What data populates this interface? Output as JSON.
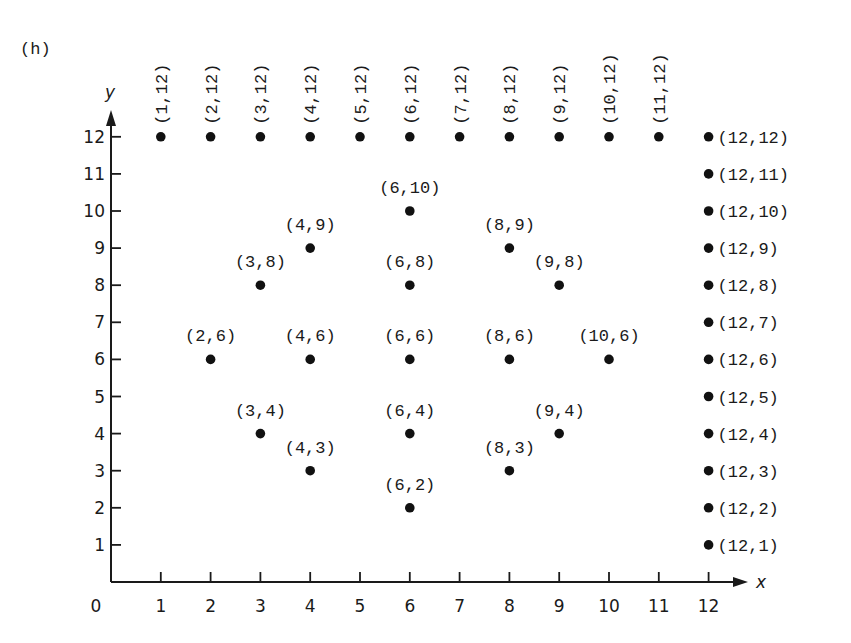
{
  "panel_label": "(h)",
  "chart_data": {
    "type": "scatter",
    "title": "",
    "panel_label": "(h)",
    "xlabel": "x",
    "ylabel": "y",
    "origin_label": "0",
    "xlim": [
      0,
      12
    ],
    "ylim": [
      0,
      12
    ],
    "grid": false,
    "legend": null,
    "x_ticks": [
      1,
      2,
      3,
      4,
      5,
      6,
      7,
      8,
      9,
      10,
      11,
      12
    ],
    "y_ticks": [
      1,
      2,
      3,
      4,
      5,
      6,
      7,
      8,
      9,
      10,
      11,
      12
    ],
    "points": [
      {
        "x": 1,
        "y": 12,
        "label": "(1,12)",
        "label_pos": "vertical"
      },
      {
        "x": 2,
        "y": 12,
        "label": "(2,12)",
        "label_pos": "vertical"
      },
      {
        "x": 3,
        "y": 12,
        "label": "(3,12)",
        "label_pos": "vertical"
      },
      {
        "x": 4,
        "y": 12,
        "label": "(4,12)",
        "label_pos": "vertical"
      },
      {
        "x": 5,
        "y": 12,
        "label": "(5,12)",
        "label_pos": "vertical"
      },
      {
        "x": 6,
        "y": 12,
        "label": "(6,12)",
        "label_pos": "vertical"
      },
      {
        "x": 7,
        "y": 12,
        "label": "(7,12)",
        "label_pos": "vertical"
      },
      {
        "x": 8,
        "y": 12,
        "label": "(8,12)",
        "label_pos": "vertical"
      },
      {
        "x": 9,
        "y": 12,
        "label": "(9,12)",
        "label_pos": "vertical"
      },
      {
        "x": 10,
        "y": 12,
        "label": "(10,12)",
        "label_pos": "vertical"
      },
      {
        "x": 11,
        "y": 12,
        "label": "(11,12)",
        "label_pos": "vertical"
      },
      {
        "x": 12,
        "y": 12,
        "label": "(12,12)",
        "label_pos": "right"
      },
      {
        "x": 12,
        "y": 11,
        "label": "(12,11)",
        "label_pos": "right"
      },
      {
        "x": 12,
        "y": 10,
        "label": "(12,10)",
        "label_pos": "right"
      },
      {
        "x": 12,
        "y": 9,
        "label": "(12,9)",
        "label_pos": "right"
      },
      {
        "x": 12,
        "y": 8,
        "label": "(12,8)",
        "label_pos": "right"
      },
      {
        "x": 12,
        "y": 7,
        "label": "(12,7)",
        "label_pos": "right"
      },
      {
        "x": 12,
        "y": 6,
        "label": "(12,6)",
        "label_pos": "right"
      },
      {
        "x": 12,
        "y": 5,
        "label": "(12,5)",
        "label_pos": "right"
      },
      {
        "x": 12,
        "y": 4,
        "label": "(12,4)",
        "label_pos": "right"
      },
      {
        "x": 12,
        "y": 3,
        "label": "(12,3)",
        "label_pos": "right"
      },
      {
        "x": 12,
        "y": 2,
        "label": "(12,2)",
        "label_pos": "right"
      },
      {
        "x": 12,
        "y": 1,
        "label": "(12,1)",
        "label_pos": "right"
      },
      {
        "x": 6,
        "y": 10,
        "label": "(6,10)",
        "label_pos": "above"
      },
      {
        "x": 4,
        "y": 9,
        "label": "(4,9)",
        "label_pos": "above"
      },
      {
        "x": 8,
        "y": 9,
        "label": "(8,9)",
        "label_pos": "above"
      },
      {
        "x": 3,
        "y": 8,
        "label": "(3,8)",
        "label_pos": "above"
      },
      {
        "x": 6,
        "y": 8,
        "label": "(6,8)",
        "label_pos": "above"
      },
      {
        "x": 9,
        "y": 8,
        "label": "(9,8)",
        "label_pos": "above"
      },
      {
        "x": 2,
        "y": 6,
        "label": "(2,6)",
        "label_pos": "above"
      },
      {
        "x": 4,
        "y": 6,
        "label": "(4,6)",
        "label_pos": "above"
      },
      {
        "x": 6,
        "y": 6,
        "label": "(6,6)",
        "label_pos": "above"
      },
      {
        "x": 8,
        "y": 6,
        "label": "(8,6)",
        "label_pos": "above"
      },
      {
        "x": 10,
        "y": 6,
        "label": "(10,6)",
        "label_pos": "above"
      },
      {
        "x": 3,
        "y": 4,
        "label": "(3,4)",
        "label_pos": "above"
      },
      {
        "x": 6,
        "y": 4,
        "label": "(6,4)",
        "label_pos": "above"
      },
      {
        "x": 9,
        "y": 4,
        "label": "(9,4)",
        "label_pos": "above"
      },
      {
        "x": 4,
        "y": 3,
        "label": "(4,3)",
        "label_pos": "above"
      },
      {
        "x": 8,
        "y": 3,
        "label": "(8,3)",
        "label_pos": "above"
      },
      {
        "x": 6,
        "y": 2,
        "label": "(6,2)",
        "label_pos": "above"
      }
    ]
  }
}
